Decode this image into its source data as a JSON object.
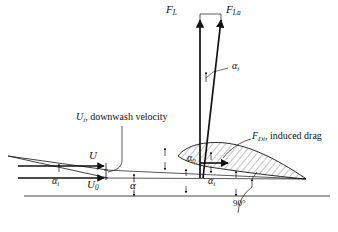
{
  "figure": {
    "type": "technical-diagram",
    "background_color": "#ffffff",
    "ink_color": "#111111",
    "hatch_color": "#555555"
  },
  "labels": {
    "lift_force": {
      "base": "F",
      "sub": "L"
    },
    "lift_force_apparent": {
      "base": "F",
      "sub": "La"
    },
    "alpha_induced_top": {
      "base": "α",
      "sub": "i"
    },
    "induced_drag": {
      "base": "F",
      "sub": "Di",
      "text": ", induced drag"
    },
    "downwash": {
      "base": "U",
      "sub": "i",
      "text": ", downwash velocity"
    },
    "velocity_u": {
      "base": "U",
      "sub": ""
    },
    "velocity_u0": {
      "base": "U",
      "sub": "0"
    },
    "alpha_i_left": {
      "base": "α",
      "sub": "i"
    },
    "alpha": {
      "base": "α",
      "sub": ""
    },
    "alpha_zero": {
      "base": "α",
      "sub": "0"
    },
    "alpha_i_mid": {
      "base": "α",
      "sub": "i"
    },
    "right_angle": "90°"
  }
}
